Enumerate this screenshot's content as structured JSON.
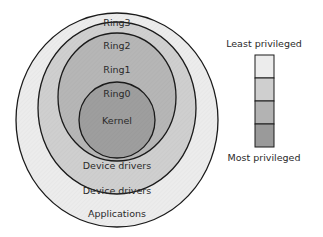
{
  "diagram": {
    "type": "protection-rings",
    "rings": [
      {
        "name": "Ring3",
        "content": "Applications",
        "fill": "#ececec"
      },
      {
        "name": "Ring2",
        "content": "Device drivers",
        "fill": "#cfcfcf"
      },
      {
        "name": "Ring1",
        "content": "Device drivers",
        "fill": "#b6b6b6"
      },
      {
        "name": "Ring0",
        "content": "Kernel",
        "fill": "#9e9e9e"
      }
    ],
    "legend": {
      "top_label": "Least privileged",
      "bottom_label": "Most privileged",
      "swatches": [
        "#ececec",
        "#cfcfcf",
        "#b3b3b3",
        "#9a9a9a"
      ]
    },
    "stroke_color": "#1a1a1a"
  }
}
